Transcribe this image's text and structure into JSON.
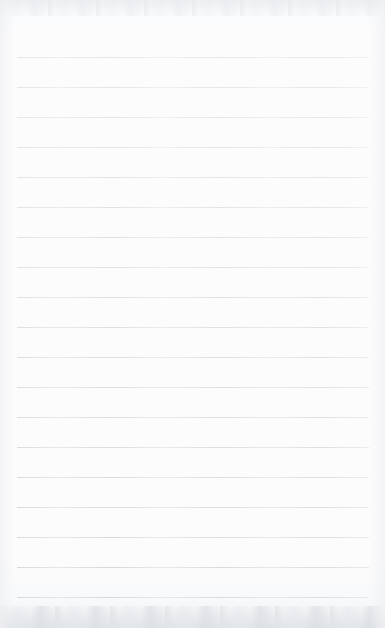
{
  "document": {
    "kind": "scanned-page",
    "title": "Blank Ruled Notepad Page",
    "description": "Scanned blank lined notepad sheet with no written content",
    "page_width": 385,
    "page_height": 628,
    "background_color": "#fbfbfc",
    "text_content": "",
    "visible_text_lines": []
  },
  "ruling": {
    "style": "horizontal-rules",
    "line_color": "#e6e8ea",
    "line_count": 19,
    "line_thickness": 1,
    "first_line_y": 57,
    "line_spacing": 30,
    "line_left_x": 17,
    "line_right_x": 369,
    "line_y_positions": [
      57,
      87,
      117,
      147,
      177,
      207,
      237,
      267,
      297,
      327,
      357,
      387,
      417,
      447,
      477,
      507,
      537,
      567,
      597
    ],
    "margin_rule": "none",
    "header_blank_height": 57,
    "footer_blank_height": 31
  },
  "scan_artifacts": {
    "top_band_color": "#eceef0",
    "bottom_band_color": "#e4e7eb",
    "edge_shadow_color": "#f0f1f3",
    "noise": "faint mottled grain along top and bottom edges"
  }
}
